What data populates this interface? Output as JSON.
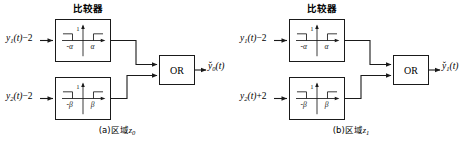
{
  "figure": {
    "type": "block-diagram",
    "panel_count": 2
  },
  "panels": [
    {
      "id": "a",
      "comparator_title": "比较器",
      "caption_prefix": "(a)区域",
      "caption_symbol": "z",
      "caption_subscript": "0",
      "inputs": [
        {
          "base": "y",
          "sub": "1",
          "expr": "(t)",
          "offset": "−2"
        },
        {
          "base": "y",
          "sub": "2",
          "expr": "(t)",
          "offset": "−2"
        }
      ],
      "comparators": [
        {
          "threshold_neg": "-α",
          "threshold_pos": "α",
          "level_label": "1",
          "shape": "dead-zone-step"
        },
        {
          "threshold_neg": "-β",
          "threshold_pos": "β",
          "level_label": "1",
          "shape": "dead-zone-step"
        }
      ],
      "gate": {
        "label": "OR",
        "inputs": 2
      },
      "output": {
        "base": "y",
        "accent": "̌",
        "sub": "0",
        "expr": "(t)"
      }
    },
    {
      "id": "b",
      "comparator_title": "比较器",
      "caption_prefix": "(b)区域",
      "caption_symbol": "z",
      "caption_subscript": "1",
      "inputs": [
        {
          "base": "y",
          "sub": "1",
          "expr": "(t)",
          "offset": "−2"
        },
        {
          "base": "y",
          "sub": "2",
          "expr": "(t)",
          "offset": "+2"
        }
      ],
      "comparators": [
        {
          "threshold_neg": "-α",
          "threshold_pos": "α",
          "level_label": "1",
          "shape": "dead-zone-step"
        },
        {
          "threshold_neg": "-β",
          "threshold_pos": "β",
          "level_label": "1",
          "shape": "dead-zone-step"
        }
      ],
      "gate": {
        "label": "OR",
        "inputs": 2
      },
      "output": {
        "base": "y",
        "accent": "̌",
        "sub": "1",
        "expr": "(t)"
      }
    }
  ],
  "colors": {
    "stroke": "#1a1a1a",
    "background": "#ffffff",
    "text": "#000000"
  }
}
